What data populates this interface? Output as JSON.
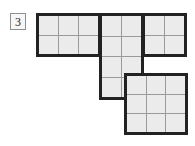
{
  "figure": {
    "label": "3",
    "label_box": {
      "border_color": "#8f8f8f",
      "fill": "#f7f7f7"
    },
    "cell_fill": "#ebebeb",
    "outline_color": "#222222",
    "gridline_color": "#9a9a9a",
    "background": "#ffffff",
    "cell_size_px": 21,
    "grid_columns": 7,
    "grid_rows": 6,
    "total_cells": 23,
    "pieces": [
      {
        "name": "top-left-piece",
        "shape": "rectangle",
        "cols": 3,
        "rows": 2,
        "cells": 6,
        "grid_col": 0,
        "grid_row": 0,
        "left_px": 0,
        "top_px": 0,
        "width_px": 65,
        "height_px": 44
      },
      {
        "name": "middle-column-piece",
        "shape": "rectangle",
        "cols": 2,
        "rows": 4,
        "cells": 8,
        "grid_col": 3,
        "grid_row": 0,
        "left_px": 63,
        "top_px": 0,
        "width_px": 45,
        "height_px": 87
      },
      {
        "name": "top-right-piece",
        "shape": "rectangle",
        "cols": 2,
        "rows": 2,
        "cells": 4,
        "grid_col": 5,
        "grid_row": 0,
        "left_px": 106,
        "top_px": 0,
        "width_px": 45,
        "height_px": 44
      },
      {
        "name": "bottom-right-piece",
        "shape": "square",
        "cols": 3,
        "rows": 3,
        "cells": 9,
        "grid_col": 4,
        "grid_row": 3,
        "left_px": 88,
        "top_px": 60,
        "width_px": 64,
        "height_px": 62
      }
    ]
  }
}
